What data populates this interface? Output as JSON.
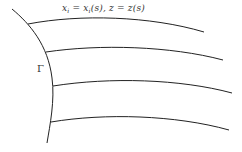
{
  "diagram": {
    "boundary_label": "Γ",
    "equation": {
      "lhs1": "x",
      "sub1": "i",
      "mid1": " = x",
      "sub2": "i",
      "rest": "(s),  z = z(s)"
    },
    "curves_count": 4,
    "stroke_color": "#222222"
  }
}
